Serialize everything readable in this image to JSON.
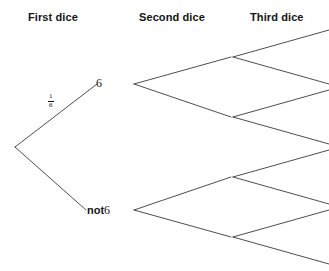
{
  "diagram": {
    "type": "probability-tree",
    "columns": [
      {
        "id": "first",
        "label": "First dice"
      },
      {
        "id": "second",
        "label": "Second dice"
      },
      {
        "id": "third",
        "label": "Third dice"
      }
    ],
    "line_color": "#3a3a3a",
    "text_color": "#151515",
    "background": "#ffffff",
    "nodes": {
      "root": {
        "x": 15,
        "y": 147,
        "label": ""
      },
      "first_six": {
        "x": 134,
        "y": 84,
        "label": "6"
      },
      "first_not6": {
        "x": 134,
        "y": 210,
        "label_bold": "not",
        "label_plain": "6"
      },
      "second_a": {
        "x": 232,
        "y": 57,
        "label": ""
      },
      "second_b": {
        "x": 232,
        "y": 117,
        "label": ""
      },
      "second_c": {
        "x": 232,
        "y": 177,
        "label": ""
      },
      "second_d": {
        "x": 232,
        "y": 237,
        "label": ""
      }
    },
    "branch_probabilities": [
      {
        "branch": "root-to-first-six",
        "numerator": "1",
        "denominator": "6",
        "display": "1/6"
      }
    ],
    "edges": [
      {
        "from": "root",
        "to": "first_six",
        "x1": 15,
        "y1": 147,
        "x2": 97,
        "y2": 84
      },
      {
        "from": "root",
        "to": "first_not6",
        "x1": 15,
        "y1": 147,
        "x2": 86,
        "y2": 210
      },
      {
        "from": "first_six",
        "to": "second_a",
        "x1": 134,
        "y1": 84,
        "x2": 231,
        "y2": 57
      },
      {
        "from": "first_six",
        "to": "second_b",
        "x1": 134,
        "y1": 84,
        "x2": 231,
        "y2": 117
      },
      {
        "from": "first_not6",
        "to": "second_c",
        "x1": 134,
        "y1": 210,
        "x2": 231,
        "y2": 177
      },
      {
        "from": "first_not6",
        "to": "second_d",
        "x1": 134,
        "y1": 210,
        "x2": 231,
        "y2": 237
      },
      {
        "from": "second_a",
        "to": "third_1",
        "x1": 233,
        "y1": 57,
        "x2": 329,
        "y2": 30
      },
      {
        "from": "second_a",
        "to": "third_2",
        "x1": 233,
        "y1": 57,
        "x2": 329,
        "y2": 84
      },
      {
        "from": "second_b",
        "to": "third_3",
        "x1": 233,
        "y1": 117,
        "x2": 329,
        "y2": 90
      },
      {
        "from": "second_b",
        "to": "third_4",
        "x1": 233,
        "y1": 117,
        "x2": 329,
        "y2": 144
      },
      {
        "from": "second_c",
        "to": "third_5",
        "x1": 233,
        "y1": 177,
        "x2": 329,
        "y2": 150
      },
      {
        "from": "second_c",
        "to": "third_6",
        "x1": 233,
        "y1": 177,
        "x2": 329,
        "y2": 204
      },
      {
        "from": "second_d",
        "to": "third_7",
        "x1": 233,
        "y1": 237,
        "x2": 329,
        "y2": 210
      },
      {
        "from": "second_d",
        "to": "third_8",
        "x1": 233,
        "y1": 237,
        "x2": 329,
        "y2": 264
      }
    ]
  }
}
